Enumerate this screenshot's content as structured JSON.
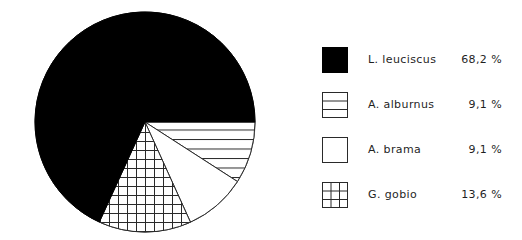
{
  "chart_data": {
    "type": "pie",
    "title": "",
    "subtitle": "",
    "xlabel": "",
    "ylabel": "",
    "grid": false,
    "legend_position": "right",
    "start_angle_deg": 0,
    "direction": "clockwise",
    "center": {
      "cx": 117,
      "cy": 116
    },
    "radius": 110,
    "categories": [
      "L. leuciscus",
      "A. alburnus",
      "A. brama",
      "G. gobio"
    ],
    "values": [
      68.2,
      9.1,
      9.1,
      13.6
    ],
    "value_labels": [
      "68,2 %",
      "9,1 %",
      "9,1 %",
      "13,6 %"
    ],
    "slices": [
      {
        "label": "L. leuciscus",
        "value": 68.2,
        "value_label": "68,2 %",
        "fill": "solid-black",
        "color": "#000000",
        "start_deg": 114.5,
        "sweep_deg": 245.5
      },
      {
        "label": "A. alburnus",
        "value": 9.1,
        "value_label": "9,1 %",
        "fill": "horizontal-lines",
        "color": "#ffffff",
        "start_deg": 0,
        "sweep_deg": 32.8
      },
      {
        "label": "A. brama",
        "value": 9.1,
        "value_label": "9,1 %",
        "fill": "blank-white",
        "color": "#ffffff",
        "start_deg": 32.8,
        "sweep_deg": 32.8
      },
      {
        "label": "G. gobio",
        "value": 13.6,
        "value_label": "13,6 %",
        "fill": "crosshatch-grid",
        "color": "#ffffff",
        "start_deg": 65.6,
        "sweep_deg": 48.9
      }
    ]
  },
  "legend": {
    "items": [
      {
        "swatch": "solid-black-swatch",
        "label": "L. leuciscus",
        "value": "68,2 %"
      },
      {
        "swatch": "horizontal-lines-swatch",
        "label": "A. alburnus",
        "value": "9,1 %"
      },
      {
        "swatch": "blank-white-swatch",
        "label": "A. brama",
        "value": "9,1 %"
      },
      {
        "swatch": "crosshatch-grid-swatch",
        "label": "G. gobio",
        "value": "13,6 %"
      }
    ]
  },
  "colors": {
    "ink": "#000000",
    "outline": "#2a2a2a",
    "background": "#ffffff",
    "text": "#1f1f1f"
  }
}
